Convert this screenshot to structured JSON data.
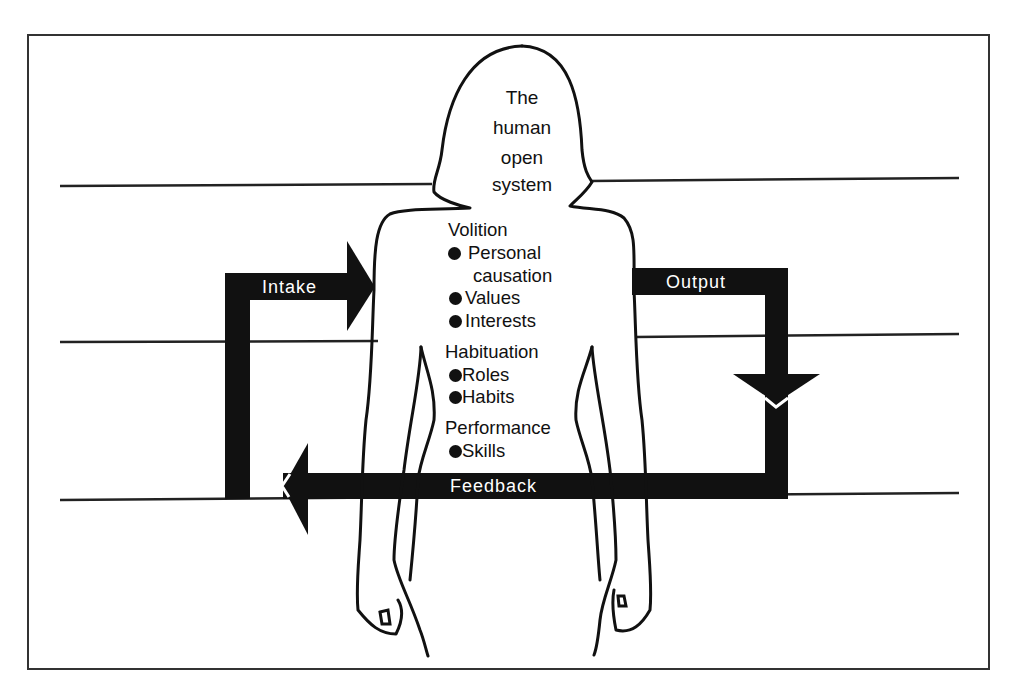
{
  "figure": {
    "type": "conceptual-diagram",
    "subject": {
      "title_lines": [
        "The",
        "human",
        "open",
        "system"
      ]
    },
    "subsystems": [
      {
        "name": "Volition",
        "items": [
          "Personal",
          "causation",
          "Values",
          "Interests"
        ],
        "bulleted_items": [
          "Personal causation",
          "Values",
          "Interests"
        ]
      },
      {
        "name": "Habituation",
        "items": [
          "Roles",
          "Habits"
        ]
      },
      {
        "name": "Performance",
        "items": [
          "Skills"
        ]
      }
    ],
    "flow": {
      "intake": "Intake",
      "output": "Output",
      "feedback": "Feedback"
    },
    "colors": {
      "ink": "#111111",
      "background": "#ffffff",
      "bar_text": "#ffffff",
      "frame": "#333333"
    }
  }
}
